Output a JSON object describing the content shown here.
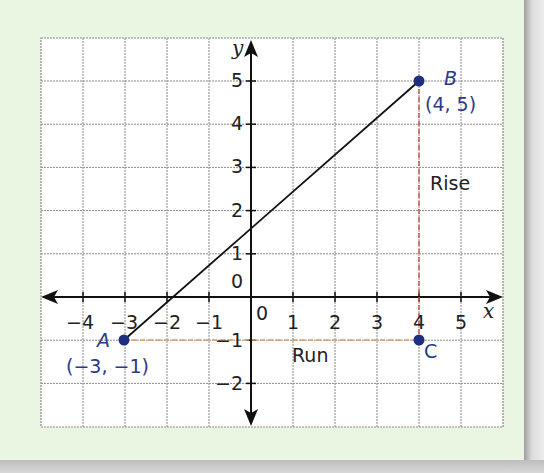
{
  "chart_data": {
    "type": "line",
    "title": "",
    "xlabel": "x",
    "ylabel": "y",
    "xlim": [
      -5,
      6
    ],
    "ylim": [
      -3,
      6
    ],
    "grid": true,
    "x_ticks": [
      -4,
      -3,
      -2,
      -1,
      0,
      1,
      2,
      3,
      4,
      5
    ],
    "y_ticks": [
      -2,
      -1,
      0,
      1,
      2,
      3,
      4,
      5
    ],
    "points": [
      {
        "name": "A",
        "x": -3,
        "y": -1,
        "label": "(−3, −1)"
      },
      {
        "name": "B",
        "x": 4,
        "y": 5,
        "label": "(4, 5)"
      },
      {
        "name": "C",
        "x": 4,
        "y": -1,
        "label": ""
      }
    ],
    "series": [
      {
        "name": "AB",
        "x": [
          -3,
          4
        ],
        "y": [
          -1,
          5
        ],
        "style": "solid",
        "color": "#111111"
      },
      {
        "name": "Run",
        "x": [
          -3,
          4
        ],
        "y": [
          -1,
          -1
        ],
        "style": "dashed",
        "color": "#e0a060"
      },
      {
        "name": "Rise",
        "x": [
          4,
          4
        ],
        "y": [
          -1,
          5
        ],
        "style": "dashed",
        "color": "#c0604a"
      }
    ],
    "annotations": [
      {
        "text": "Rise",
        "x": 4.3,
        "y": 2.5
      },
      {
        "text": "Run",
        "x": 1,
        "y": -1.5
      }
    ]
  },
  "labels": {
    "x_axis": "x",
    "y_axis": "y",
    "rise": "Rise",
    "run": "Run",
    "origin_y": "0",
    "origin_x": "0",
    "point_a": "A",
    "point_b": "B",
    "point_c": "C",
    "coord_a": "(−3, −1)",
    "coord_b": "(4, 5)",
    "xt_m4": "−4",
    "xt_m3": "−3",
    "xt_m2": "−2",
    "xt_m1": "−1",
    "xt_1": "1",
    "xt_2": "2",
    "xt_3": "3",
    "xt_4": "4",
    "xt_5": "5",
    "yt_5": "5",
    "yt_4": "4",
    "yt_3": "3",
    "yt_2": "2",
    "yt_1": "1",
    "yt_m1": "−1",
    "yt_m2": "−2"
  },
  "colors": {
    "background": "#eaf6e2",
    "grid": "#8a8a8a",
    "point": "#1f2f80",
    "label": "#2a3a8a",
    "run_line": "#e0a060",
    "rise_line": "#c0604a"
  }
}
